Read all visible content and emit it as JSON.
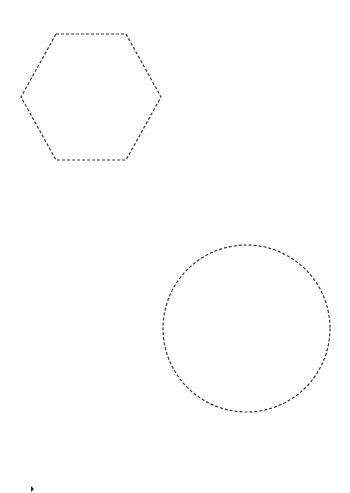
{
  "canvas": {
    "width": 350,
    "height": 493,
    "background": "#ffffff"
  },
  "shapes": [
    {
      "kind": "hexagon",
      "points": "56,34 126,34 161,97 126,160 56,160 21,97",
      "stroke": "#333333",
      "stroke_width": 1.2,
      "dash": "3,2",
      "fill": "none"
    },
    {
      "kind": "circle",
      "cx": 246.5,
      "cy": 328.5,
      "r": 83.5,
      "stroke": "#333333",
      "stroke_width": 1.2,
      "dash": "3,2",
      "fill": "none"
    }
  ],
  "cursor": {
    "points": "31,486 34,489 31,492",
    "fill": "#222222"
  }
}
